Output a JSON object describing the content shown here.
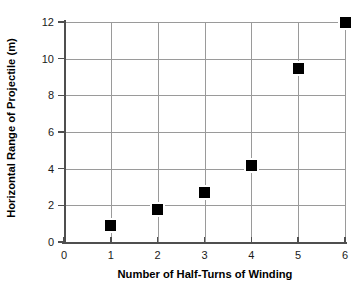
{
  "chart_data": {
    "type": "scatter",
    "title": "",
    "xlabel": "Number of Half-Turns of Winding",
    "ylabel": "Horizontal Range of Projectile (m)",
    "xlim": [
      0,
      6
    ],
    "ylim": [
      0,
      12
    ],
    "xticks": [
      "0",
      "1",
      "2",
      "3",
      "4",
      "5",
      "6"
    ],
    "yticks": [
      "0",
      "2",
      "4",
      "6",
      "8",
      "10",
      "12"
    ],
    "xtick_values": [
      0,
      1,
      2,
      3,
      4,
      5,
      6
    ],
    "ytick_values": [
      0,
      2,
      4,
      6,
      8,
      10,
      12
    ],
    "grid": "both",
    "legend": "none",
    "marker_style": "filled-square",
    "marker_color": "#000000",
    "x": [
      1,
      2,
      3,
      4,
      5,
      6
    ],
    "values": [
      0.9,
      1.8,
      2.7,
      4.2,
      9.45,
      12.0
    ],
    "points": [
      {
        "x": 1,
        "y": 0.9
      },
      {
        "x": 2,
        "y": 1.8
      },
      {
        "x": 3,
        "y": 2.7
      },
      {
        "x": 4,
        "y": 4.2
      },
      {
        "x": 5,
        "y": 9.45
      },
      {
        "x": 6,
        "y": 12.0
      }
    ]
  }
}
